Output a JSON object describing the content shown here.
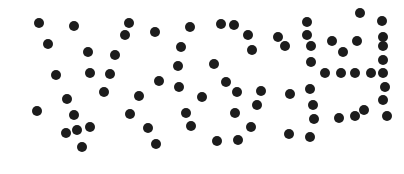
{
  "captcha": {
    "description": "Dotted-pattern CAPTCHA image",
    "dot_color": "#1c1c1c",
    "background": "#ffffff",
    "dot_diameter": 10,
    "dots": [
      [
        39,
        23
      ],
      [
        74,
        26
      ],
      [
        48,
        44
      ],
      [
        88,
        52
      ],
      [
        115,
        55
      ],
      [
        56,
        75
      ],
      [
        90,
        73
      ],
      [
        110,
        74
      ],
      [
        104,
        92
      ],
      [
        67,
        99
      ],
      [
        37,
        111
      ],
      [
        74,
        115
      ],
      [
        90,
        127
      ],
      [
        66,
        133
      ],
      [
        77,
        130
      ],
      [
        82,
        147
      ],
      [
        129,
        23
      ],
      [
        125,
        35
      ],
      [
        139,
        96
      ],
      [
        130,
        114
      ],
      [
        155,
        32
      ],
      [
        190,
        27
      ],
      [
        221,
        24
      ],
      [
        234,
        25
      ],
      [
        248,
        35
      ],
      [
        252,
        50
      ],
      [
        181,
        47
      ],
      [
        178,
        66
      ],
      [
        214,
        64
      ],
      [
        159,
        81
      ],
      [
        179,
        87
      ],
      [
        226,
        82
      ],
      [
        237,
        92
      ],
      [
        261,
        91
      ],
      [
        202,
        97
      ],
      [
        257,
        105
      ],
      [
        186,
        113
      ],
      [
        235,
        113
      ],
      [
        148,
        128
      ],
      [
        191,
        126
      ],
      [
        251,
        127
      ],
      [
        156,
        144
      ],
      [
        217,
        141
      ],
      [
        238,
        140
      ],
      [
        360,
        13
      ],
      [
        307,
        22
      ],
      [
        382,
        21
      ],
      [
        307,
        35
      ],
      [
        278,
        37
      ],
      [
        285,
        46
      ],
      [
        311,
        46
      ],
      [
        332,
        41
      ],
      [
        357,
        41
      ],
      [
        343,
        52
      ],
      [
        383,
        37
      ],
      [
        383,
        46
      ],
      [
        311,
        62
      ],
      [
        383,
        60
      ],
      [
        325,
        73
      ],
      [
        341,
        73
      ],
      [
        355,
        73
      ],
      [
        371,
        73
      ],
      [
        383,
        73
      ],
      [
        385,
        87
      ],
      [
        290,
        94
      ],
      [
        310,
        89
      ],
      [
        313,
        105
      ],
      [
        383,
        100
      ],
      [
        364,
        110
      ],
      [
        314,
        119
      ],
      [
        339,
        118
      ],
      [
        355,
        116
      ],
      [
        387,
        116
      ],
      [
        289,
        134
      ],
      [
        310,
        137
      ]
    ]
  }
}
